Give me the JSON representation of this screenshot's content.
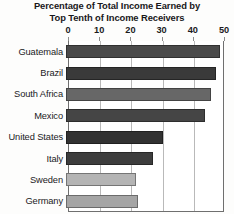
{
  "chart_data": {
    "type": "bar",
    "orientation": "horizontal",
    "title": "Percentage of Total Income Earned by Top Tenth of Income Receivers",
    "title_lines": [
      "Percentage of Total Income Earned by",
      "Top Tenth of Income Receivers"
    ],
    "xlabel": "",
    "ylabel": "",
    "xlim": [
      0,
      50
    ],
    "ticks": [
      0,
      10,
      20,
      30,
      40,
      50
    ],
    "tick_labels": [
      "0",
      "10",
      "20",
      "30",
      "40",
      "50"
    ],
    "grid": true,
    "grid_axis": "x",
    "legend": false,
    "axis_position": "top",
    "categories": [
      "Guatemala",
      "Brazil",
      "South Africa",
      "Mexico",
      "United States",
      "Italy",
      "Sweden",
      "Germany"
    ],
    "values": [
      49.5,
      48,
      46.5,
      44.5,
      31,
      28,
      22.3,
      23
    ],
    "bars": [
      {
        "category": "Guatemala",
        "value": 49.5,
        "color": "#4a4a4a"
      },
      {
        "category": "Brazil",
        "value": 48,
        "color": "#3a3a3a"
      },
      {
        "category": "South Africa",
        "value": 46.5,
        "color": "#676767"
      },
      {
        "category": "Mexico",
        "value": 44.5,
        "color": "#454545"
      },
      {
        "category": "United States",
        "value": 31,
        "color": "#323232"
      },
      {
        "category": "Italy",
        "value": 28,
        "color": "#3d3d3d"
      },
      {
        "category": "Sweden",
        "value": 22.3,
        "color": "#b4b4b4"
      },
      {
        "category": "Germany",
        "value": 23,
        "color": "#a5a5a5"
      }
    ]
  },
  "colors": {
    "background": "#fdfdfc",
    "plot_background": "#ffffff",
    "text": "#1b1a1c",
    "gridline": "#b9b9b9",
    "axis": "#6f6f6f"
  }
}
